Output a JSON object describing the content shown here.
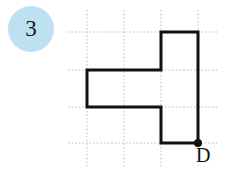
{
  "figure": {
    "badge": {
      "number": "3",
      "fill_color": "#bde0f2",
      "text_color": "#1a1a1a"
    },
    "grid": {
      "color": "#bcd9ec",
      "style": "dotted",
      "vertical_lines_x": [
        87,
        124,
        161,
        198
      ],
      "horizontal_lines_y": [
        32,
        70,
        107,
        143
      ],
      "vertical_extent_y": [
        10,
        166
      ],
      "horizontal_extent_x": [
        68,
        218
      ]
    },
    "shape": {
      "name": "t-shaped-polygon",
      "stroke_color": "#111111",
      "stroke_width": 3,
      "fill": "none",
      "vertices": [
        [
          161,
          32
        ],
        [
          198,
          32
        ],
        [
          198,
          143
        ],
        [
          161,
          143
        ],
        [
          161,
          107
        ],
        [
          87,
          107
        ],
        [
          87,
          70
        ],
        [
          161,
          70
        ]
      ]
    },
    "marked_point": {
      "label": "D",
      "x": 198,
      "y": 143,
      "dot_radius": 4,
      "dot_color": "#111111",
      "label_x": 196,
      "label_y": 145
    }
  }
}
